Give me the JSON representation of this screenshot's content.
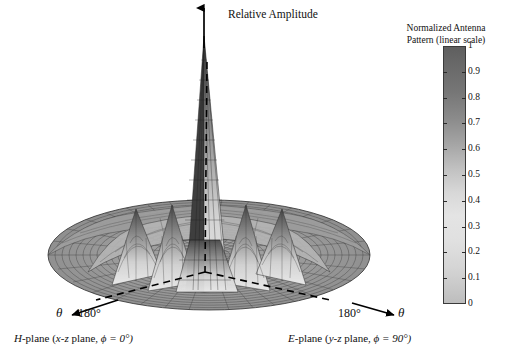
{
  "figure": {
    "vertical_axis_label": "Relative Amplitude",
    "background": "#ffffff"
  },
  "colorbar": {
    "title_line1": "Normalized Antenna",
    "title_line2": "Pattern (linear scale)",
    "ticks": [
      "1",
      "0.9",
      "0.8",
      "0.7",
      "0.6",
      "0.5",
      "0.4",
      "0.3",
      "0.2",
      "0.1",
      "0"
    ],
    "min": 0,
    "max": 1,
    "orientation": "vertical",
    "high_color": "#5f5f5f",
    "low_color": "#c8c8c8"
  },
  "annotations": {
    "left_angle": "180°",
    "right_angle": "180°",
    "left_theta": "θ",
    "right_theta": "θ",
    "left_caption": "H-plane (x-z plane, ϕ = 0°)",
    "left_caption_parts": {
      "plane": "H",
      "rest": "-plane (",
      "coord": "x-z",
      "mid": " plane, ",
      "phi": "ϕ = 0°)"
    },
    "right_caption": "E-plane (y-z plane, ϕ = 90°)",
    "right_caption_parts": {
      "plane": "E",
      "rest": "-plane (",
      "coord": "y-z",
      "mid": " plane, ",
      "phi": "ϕ = 90°)"
    }
  },
  "chart_data": {
    "type": "surface",
    "title": "",
    "zlabel": "Relative Amplitude",
    "zlim": [
      0,
      1
    ],
    "colorbar_label": "Normalized Antenna Pattern (linear scale)",
    "clim": [
      0,
      1
    ],
    "colormap": "grayscale-inverted",
    "grid": true,
    "mesh": {
      "radial_lines": 48,
      "circumferential_lines": 26
    },
    "projection": {
      "type": "3d-oblique",
      "elevation_deg": 18,
      "azimuth_deg": 0
    },
    "features": {
      "main_lobe": {
        "peak_value": 1.0,
        "position": "boresight (theta = 0)",
        "half_power_beamwidth_deg": 6
      },
      "sidelobe_ring_1": {
        "peak_value": 0.22,
        "theta_deg": 22
      },
      "sidelobe_ring_2": {
        "peak_value": 0.11,
        "theta_deg": 40
      },
      "sidelobe_ring_3": {
        "peak_value": 0.06,
        "theta_deg": 58
      },
      "nulls_deg": [
        14,
        30,
        48,
        68
      ]
    },
    "radial_profile": {
      "theta_deg": [
        0,
        2,
        4,
        6,
        8,
        10,
        12,
        14,
        16,
        18,
        20,
        22,
        24,
        26,
        28,
        30,
        32,
        34,
        36,
        38,
        40,
        42,
        44,
        46,
        48,
        50,
        52,
        54,
        56,
        58,
        60,
        62,
        64,
        66,
        68,
        70,
        75,
        80,
        85,
        90
      ],
      "amplitude": [
        1.0,
        0.93,
        0.74,
        0.49,
        0.26,
        0.1,
        0.02,
        0.0,
        0.05,
        0.13,
        0.19,
        0.22,
        0.2,
        0.14,
        0.07,
        0.0,
        0.03,
        0.07,
        0.1,
        0.11,
        0.11,
        0.09,
        0.06,
        0.03,
        0.0,
        0.02,
        0.04,
        0.055,
        0.06,
        0.06,
        0.05,
        0.04,
        0.025,
        0.01,
        0.0,
        0.01,
        0.025,
        0.03,
        0.025,
        0.015
      ]
    },
    "planes": [
      {
        "name": "H-plane",
        "coords": "x-z plane",
        "phi_deg": 0,
        "edge_angle_label": "180°",
        "axis_symbol": "θ"
      },
      {
        "name": "E-plane",
        "coords": "y-z plane",
        "phi_deg": 90,
        "edge_angle_label": "180°",
        "axis_symbol": "θ"
      }
    ]
  }
}
